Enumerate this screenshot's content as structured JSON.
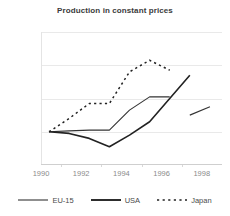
{
  "chart_data": {
    "type": "line",
    "title": "Production in constant prices",
    "xlabel": "",
    "ylabel": "",
    "xlim": [
      1989.6,
      1998.6
    ],
    "ylim": [
      80,
      160
    ],
    "yticks": [
      80,
      100,
      120,
      140,
      160
    ],
    "xticks": [
      1990,
      1992,
      1994,
      1996,
      1998
    ],
    "xticks_minor": [
      1991,
      1993,
      1995,
      1997
    ],
    "grid": true,
    "legend_position": "bottom",
    "series": [
      {
        "name": "EU-15",
        "color": "#333333",
        "style": "solid",
        "width": 1.1,
        "x": [
          1990,
          1991,
          1992,
          1993,
          1994,
          1995,
          1996
        ],
        "values": [
          100,
          100.5,
          101,
          101,
          113,
          121,
          121
        ]
      },
      {
        "name": "EU-15",
        "color": "#333333",
        "style": "solid",
        "width": 1.1,
        "x": [
          1997,
          1998
        ],
        "values": [
          110,
          115
        ]
      },
      {
        "name": "USA",
        "color": "#222222",
        "style": "solid",
        "width": 1.6,
        "x": [
          1990,
          1991,
          1992,
          1993,
          1994,
          1995,
          1996,
          1997
        ],
        "values": [
          100,
          99,
          96,
          91,
          98,
          106,
          120,
          134
        ]
      },
      {
        "name": "Japan",
        "color": "#222222",
        "style": "dashed",
        "width": 1.5,
        "x": [
          1990,
          1991,
          1992,
          1993,
          1994,
          1995,
          1996
        ],
        "values": [
          100,
          108,
          117,
          117,
          136,
          143,
          137
        ]
      }
    ]
  },
  "legend": {
    "items": [
      {
        "label": "EU-15",
        "style": "solid-thin"
      },
      {
        "label": "USA",
        "style": "solid-thick"
      },
      {
        "label": "Japan",
        "style": "dashed"
      }
    ]
  },
  "ytick_labels": [
    "160",
    "140",
    "120",
    "100",
    "80"
  ],
  "xtick_labels": [
    "1990",
    "1992",
    "1994",
    "1996",
    "1998"
  ]
}
